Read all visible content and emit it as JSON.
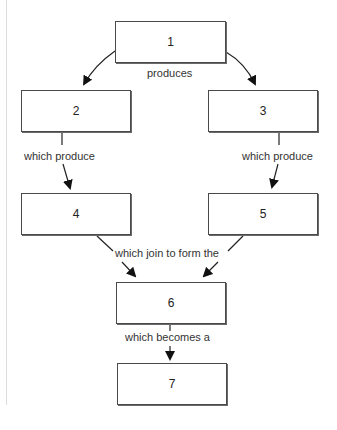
{
  "diagram": {
    "nodes": [
      {
        "id": "1",
        "label": "1"
      },
      {
        "id": "2",
        "label": "2"
      },
      {
        "id": "3",
        "label": "3"
      },
      {
        "id": "4",
        "label": "4"
      },
      {
        "id": "5",
        "label": "5"
      },
      {
        "id": "6",
        "label": "6"
      },
      {
        "id": "7",
        "label": "7"
      }
    ],
    "edge_labels": {
      "produces": "produces",
      "which_produce_left": "which produce",
      "which_produce_right": "which produce",
      "which_join": "which join to form the",
      "which_becomes": "which becomes a"
    },
    "edges": [
      {
        "from": "1",
        "to": "2",
        "label": "produces"
      },
      {
        "from": "1",
        "to": "3",
        "label": "produces"
      },
      {
        "from": "2",
        "to": "4",
        "label": "which produce"
      },
      {
        "from": "3",
        "to": "5",
        "label": "which produce"
      },
      {
        "from": "4",
        "to": "6",
        "label": "which join to form the"
      },
      {
        "from": "5",
        "to": "6",
        "label": "which join to form the"
      },
      {
        "from": "6",
        "to": "7",
        "label": "which becomes a"
      }
    ]
  }
}
